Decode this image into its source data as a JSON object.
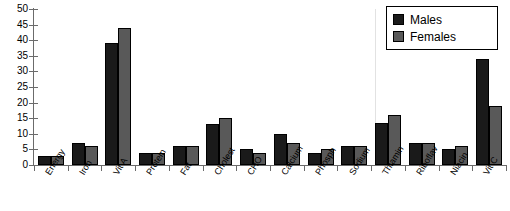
{
  "chart_data": {
    "type": "bar",
    "title": "",
    "xlabel": "",
    "ylabel": "",
    "ylim": [
      0,
      50
    ],
    "ytick_step": 5,
    "yticks": [
      0,
      5,
      10,
      15,
      20,
      25,
      30,
      35,
      40,
      45,
      50
    ],
    "grid": false,
    "legend_position": "top-right",
    "categories": [
      "Energy",
      "Iron",
      "Vit A",
      "Protein",
      "Fat",
      "Cholest",
      "CHO",
      "Calcium",
      "Phosph",
      "Sodium",
      "Thiamin",
      "Riboflav",
      "Niacin",
      "Vit C"
    ],
    "series": [
      {
        "name": "Males",
        "color": "#1a1a1a",
        "values": [
          3,
          7,
          39,
          4,
          6,
          13,
          5,
          10,
          4,
          6,
          13.5,
          7,
          5,
          34
        ]
      },
      {
        "name": "Females",
        "color": "#595959",
        "values": [
          3,
          6,
          44,
          4,
          6,
          15,
          4,
          7,
          5,
          6,
          16,
          7,
          6,
          19
        ]
      }
    ]
  },
  "legend": {
    "entries": [
      {
        "label": "Males",
        "swatch": "males-swatch"
      },
      {
        "label": "Females",
        "swatch": "females-swatch"
      }
    ]
  }
}
